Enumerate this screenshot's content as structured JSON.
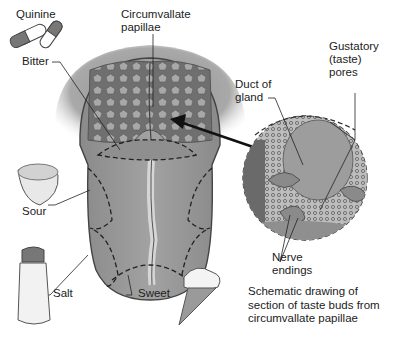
{
  "diagram": {
    "type": "anatomy-illustration",
    "labels": {
      "quinine": "Quinine",
      "circumvallate": "Circumvallate papillae",
      "circumvallate_line1": "Circumvallate",
      "circumvallate_line2": "papillae",
      "bitter": "Bitter",
      "gustatory_line1": "Gustatory",
      "gustatory_line2": "(taste)",
      "gustatory_line3": "pores",
      "duct_line1": "Duct of",
      "duct_line2": "gland",
      "sour": "Sour",
      "salt": "Salt",
      "sweet": "Sweet",
      "nerve_line1": "Nerve",
      "nerve_line2": "endings"
    },
    "caption": {
      "line1": "Schematic drawing of",
      "line2": "section of taste buds from",
      "line3": "circumvallate papillae"
    },
    "taste_regions": [
      {
        "name": "Bitter",
        "location": "back of tongue (circumvallate papillae)",
        "icon": "quinine-capsules"
      },
      {
        "name": "Sour",
        "location": "sides of tongue",
        "icon": "lemon"
      },
      {
        "name": "Salt",
        "location": "front sides of tongue",
        "icon": "salt-shaker"
      },
      {
        "name": "Sweet",
        "location": "tip of tongue",
        "icon": "ice-cream-cone"
      }
    ],
    "colors": {
      "tongue": "#8c8c8c",
      "papillae_region": "#7a7a7a",
      "outline": "#3a3a3a",
      "background": "#ffffff"
    }
  }
}
